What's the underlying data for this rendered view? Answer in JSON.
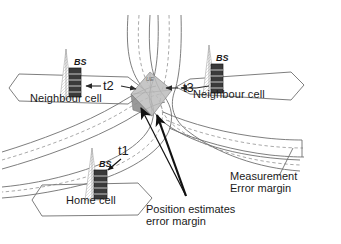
{
  "figure": {
    "type": "diagram"
  },
  "colors": {
    "line": "#4a4a4a",
    "line_light": "#8c8c8c",
    "dashed": "#9a9a9a",
    "arrow_black": "#111111",
    "estimate_fill": "#b9b9b9",
    "estimate_fill_dark": "#8e8e8e",
    "tower_fill": "#3a3a3a",
    "tower_band": "#bdbdbd",
    "text": "#1a1a1a",
    "background": "#ffffff"
  },
  "cells": [
    {
      "id": "left",
      "label": "Neighbour cell"
    },
    {
      "id": "right",
      "label": "Neighbour cell"
    },
    {
      "id": "home",
      "label": "Home cell"
    }
  ],
  "base_stations": [
    {
      "id": "bs-left",
      "label": "BS"
    },
    {
      "id": "bs-right",
      "label": "BS"
    },
    {
      "id": "bs-home",
      "label": "BS"
    }
  ],
  "timing_labels": [
    {
      "id": "t1",
      "label": "t1",
      "station": "bs-home",
      "arrow": "single"
    },
    {
      "id": "t2",
      "label": "t2",
      "station": "bs-left",
      "arrow": "double"
    },
    {
      "id": "t3",
      "label": "t3",
      "station": "bs-right",
      "arrow": "double"
    }
  ],
  "ue": {
    "label": "UE"
  },
  "annotations": [
    {
      "id": "measurement-error-margin",
      "line1": "Measurement",
      "line2": "Error margin",
      "target": "measurement-band-right"
    },
    {
      "id": "position-estimates-error-margin",
      "line1": "Position estimates",
      "line2": "error margin",
      "target": "position-estimate-region"
    }
  ],
  "measurement_bands": [
    {
      "id": "band-top-left",
      "style": "solid-dashed-solid",
      "origin": "top"
    },
    {
      "id": "band-top-right",
      "style": "solid-dashed-solid",
      "origin": "top"
    },
    {
      "id": "band-lower",
      "style": "solid-dashed-solid",
      "origin": "lower-left"
    }
  ]
}
